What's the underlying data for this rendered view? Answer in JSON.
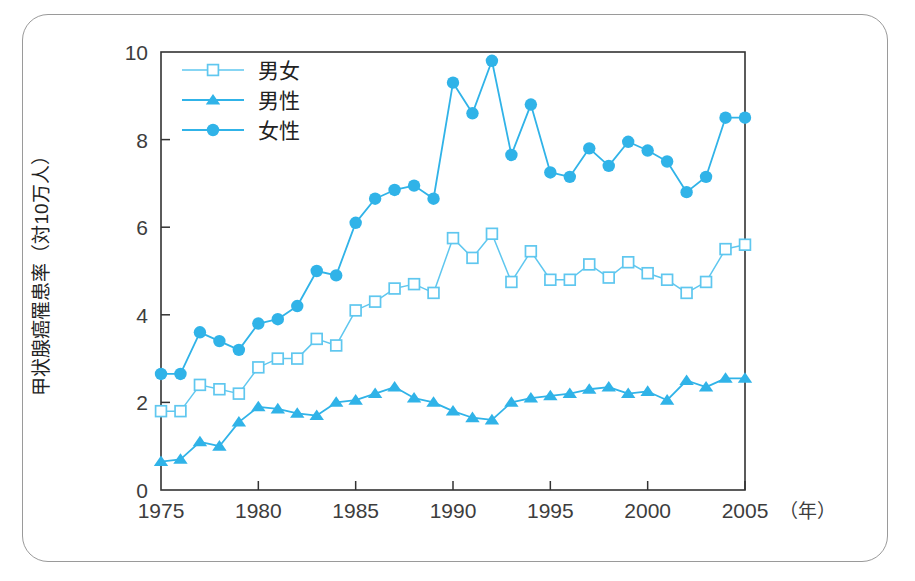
{
  "chart_data": {
    "type": "line",
    "title": "",
    "xlabel": "年",
    "ylabel": "甲状腺癌罹患率（対10万人）",
    "xlim": [
      1975,
      2005
    ],
    "ylim": [
      0,
      10
    ],
    "x_ticks": [
      1975,
      1980,
      1985,
      1990,
      1995,
      2000,
      2005
    ],
    "y_ticks": [
      0,
      2,
      4,
      6,
      8,
      10
    ],
    "x_unit_note": "（年）",
    "grid": false,
    "legend_position": "top-left",
    "accent_color": "#30b3e8",
    "frame_color": "#9a9a9a",
    "axis_color": "#333333",
    "x": [
      1975,
      1976,
      1977,
      1978,
      1979,
      1980,
      1981,
      1982,
      1983,
      1984,
      1985,
      1986,
      1987,
      1988,
      1989,
      1990,
      1991,
      1992,
      1993,
      1994,
      1995,
      1996,
      1997,
      1998,
      1999,
      2000,
      2001,
      2002,
      2003,
      2004,
      2005
    ],
    "series": [
      {
        "name": "男女",
        "marker": "open-square",
        "color": "#5fc7ef",
        "values": [
          1.8,
          1.8,
          2.4,
          2.3,
          2.2,
          2.8,
          3.0,
          3.0,
          3.45,
          3.3,
          4.1,
          4.3,
          4.6,
          4.7,
          4.5,
          5.75,
          5.3,
          5.85,
          4.75,
          5.45,
          4.8,
          4.8,
          5.15,
          4.85,
          5.2,
          4.95,
          4.8,
          4.5,
          4.75,
          5.5,
          5.6
        ]
      },
      {
        "name": "男性",
        "marker": "filled-triangle",
        "color": "#30b3e8",
        "values": [
          0.65,
          0.7,
          1.1,
          1.0,
          1.55,
          1.9,
          1.85,
          1.75,
          1.7,
          2.0,
          2.05,
          2.2,
          2.35,
          2.1,
          2.0,
          1.8,
          1.65,
          1.6,
          2.0,
          2.1,
          2.15,
          2.2,
          2.3,
          2.35,
          2.2,
          2.25,
          2.05,
          2.5,
          2.35,
          2.55,
          2.55
        ]
      },
      {
        "name": "女性",
        "marker": "filled-circle",
        "color": "#30b3e8",
        "values": [
          2.65,
          2.65,
          3.6,
          3.4,
          3.2,
          3.8,
          3.9,
          4.2,
          5.0,
          4.9,
          6.1,
          6.65,
          6.85,
          6.95,
          6.65,
          9.3,
          8.6,
          9.8,
          7.65,
          8.8,
          7.25,
          7.15,
          7.8,
          7.4,
          7.95,
          7.75,
          7.5,
          6.8,
          7.15,
          8.5,
          8.5
        ]
      }
    ]
  },
  "legend": {
    "items": [
      {
        "label": "男女",
        "marker": "open-square"
      },
      {
        "label": "男性",
        "marker": "filled-triangle"
      },
      {
        "label": "女性",
        "marker": "filled-circle"
      }
    ]
  },
  "axes": {
    "y_title": "甲状腺癌罹患率（対10万人）",
    "x_unit": "（年）"
  }
}
